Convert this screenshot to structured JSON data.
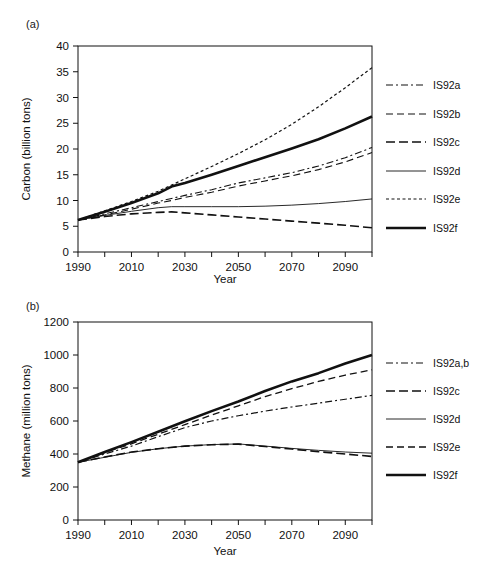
{
  "figure": {
    "background": "#ffffff",
    "line_color": "#111111"
  },
  "panels": [
    {
      "id": "a",
      "label": "(a)",
      "xlabel": "Year",
      "ylabel": "Carbon (billion tons)"
    },
    {
      "id": "b",
      "label": "(b)",
      "xlabel": "Year",
      "ylabel": "Methane (million tons)"
    }
  ],
  "chart_data": [
    {
      "type": "line",
      "panel": "a",
      "title": "",
      "xlabel": "Year",
      "ylabel": "Carbon (billion tons)",
      "xlim": [
        1990,
        2100
      ],
      "ylim": [
        0,
        40
      ],
      "yticks": [
        0,
        5,
        10,
        15,
        20,
        25,
        30,
        35,
        40
      ],
      "ytick_labels": [
        "0",
        "5",
        "10",
        "15",
        "20",
        "25",
        "30",
        "35",
        "40"
      ],
      "xticks": [
        1990,
        2000,
        2010,
        2020,
        2030,
        2040,
        2050,
        2060,
        2070,
        2080,
        2090,
        2100
      ],
      "xtick_labels": [
        "1990",
        "",
        "2010",
        "",
        "2030",
        "",
        "2050",
        "",
        "2070",
        "",
        "2090",
        ""
      ],
      "grid": false,
      "legend_position": "right",
      "x": [
        1990,
        2000,
        2010,
        2020,
        2025,
        2030,
        2040,
        2050,
        2060,
        2070,
        2080,
        2090,
        2100
      ],
      "series": [
        {
          "name": "IS92a",
          "style": "dashdot",
          "width": 1.1,
          "values": [
            6.2,
            7.4,
            8.6,
            9.8,
            10.4,
            11.0,
            12.1,
            13.4,
            14.4,
            15.4,
            16.7,
            18.3,
            20.3
          ]
        },
        {
          "name": "IS92b",
          "style": "dashed-medium",
          "width": 1.1,
          "values": [
            6.2,
            7.2,
            8.3,
            9.5,
            10.0,
            10.6,
            11.6,
            12.8,
            13.8,
            14.8,
            16.0,
            17.5,
            19.3
          ]
        },
        {
          "name": "IS92c",
          "style": "dashed-long",
          "width": 1.6,
          "values": [
            6.2,
            6.9,
            7.4,
            7.7,
            7.8,
            7.6,
            7.2,
            6.8,
            6.4,
            6.0,
            5.6,
            5.2,
            4.7
          ]
        },
        {
          "name": "IS92d",
          "style": "solid-thin",
          "width": 0.9,
          "values": [
            6.2,
            7.1,
            7.9,
            8.6,
            8.8,
            8.8,
            8.8,
            8.8,
            8.9,
            9.1,
            9.4,
            9.8,
            10.3
          ]
        },
        {
          "name": "IS92e",
          "style": "dotted-short",
          "width": 1.2,
          "values": [
            6.2,
            8.0,
            9.8,
            11.8,
            13.0,
            14.2,
            16.6,
            19.1,
            21.8,
            24.8,
            28.2,
            31.9,
            35.8
          ]
        },
        {
          "name": "IS92f",
          "style": "solid-thick",
          "width": 2.6,
          "values": [
            6.2,
            7.8,
            9.5,
            11.4,
            12.7,
            13.4,
            15.0,
            16.7,
            18.4,
            20.1,
            21.9,
            24.0,
            26.3
          ]
        }
      ],
      "legend": [
        {
          "name": "IS92a",
          "style": "dashdot",
          "width": 1.1
        },
        {
          "name": "IS92b",
          "style": "dashed-medium",
          "width": 1.1
        },
        {
          "name": "IS92c",
          "style": "dashed-long",
          "width": 1.6
        },
        {
          "name": "IS92d",
          "style": "solid-thin",
          "width": 0.9
        },
        {
          "name": "IS92e",
          "style": "dotted-short",
          "width": 1.2
        },
        {
          "name": "IS92f",
          "style": "solid-thick",
          "width": 2.6
        }
      ]
    },
    {
      "type": "line",
      "panel": "b",
      "title": "",
      "xlabel": "Year",
      "ylabel": "Methane (million tons)",
      "xlim": [
        1990,
        2100
      ],
      "ylim": [
        0,
        1200
      ],
      "yticks": [
        0,
        200,
        400,
        600,
        800,
        1000,
        1200
      ],
      "ytick_labels": [
        "0",
        "200",
        "400",
        "600",
        "800",
        "1000",
        "1200"
      ],
      "xticks": [
        1990,
        2000,
        2010,
        2020,
        2030,
        2040,
        2050,
        2060,
        2070,
        2080,
        2090,
        2100
      ],
      "xtick_labels": [
        "1990",
        "",
        "2010",
        "",
        "2030",
        "",
        "2050",
        "",
        "2070",
        "",
        "2090",
        ""
      ],
      "grid": false,
      "legend_position": "right",
      "x": [
        1990,
        2000,
        2010,
        2020,
        2030,
        2040,
        2050,
        2060,
        2070,
        2080,
        2090,
        2100
      ],
      "series": [
        {
          "name": "IS92a,b",
          "style": "dashdot",
          "width": 1.2,
          "values": [
            350,
            400,
            448,
            505,
            560,
            600,
            632,
            660,
            685,
            708,
            732,
            755
          ]
        },
        {
          "name": "IS92c",
          "style": "dashed-long",
          "width": 1.6,
          "values": [
            350,
            382,
            412,
            432,
            448,
            456,
            460,
            445,
            430,
            414,
            400,
            385
          ]
        },
        {
          "name": "IS92d",
          "style": "solid-thin",
          "width": 0.9,
          "values": [
            350,
            380,
            410,
            432,
            448,
            457,
            461,
            448,
            434,
            422,
            412,
            405
          ]
        },
        {
          "name": "IS92e",
          "style": "dashed-medium",
          "width": 1.3,
          "values": [
            350,
            408,
            462,
            520,
            578,
            636,
            692,
            748,
            796,
            840,
            878,
            910
          ]
        },
        {
          "name": "IS92f",
          "style": "solid-thick",
          "width": 2.6,
          "values": [
            350,
            412,
            472,
            535,
            598,
            660,
            718,
            782,
            840,
            890,
            948,
            1000
          ]
        }
      ],
      "legend": [
        {
          "name": "IS92a,b",
          "style": "dashdot",
          "width": 1.2
        },
        {
          "name": "IS92c",
          "style": "dashed-long",
          "width": 1.6
        },
        {
          "name": "IS92d",
          "style": "solid-thin",
          "width": 0.9
        },
        {
          "name": "IS92e",
          "style": "dashed-medium",
          "width": 1.3
        },
        {
          "name": "IS92f",
          "style": "solid-thick",
          "width": 2.6
        }
      ]
    }
  ]
}
